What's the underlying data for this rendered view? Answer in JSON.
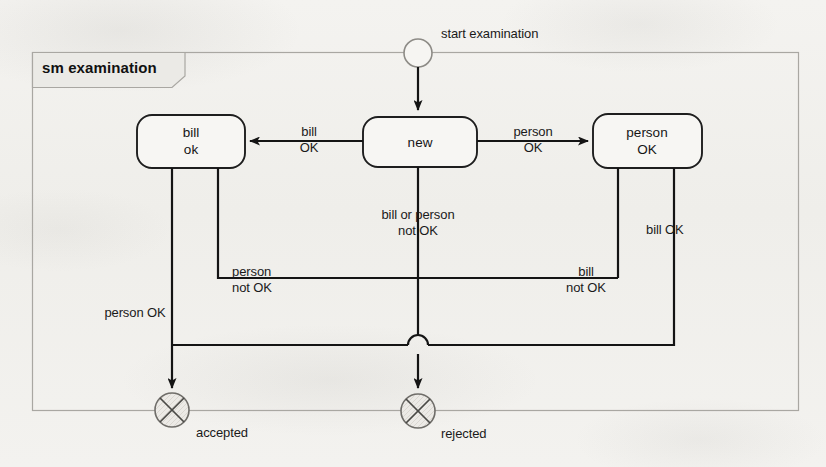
{
  "diagram": {
    "kind": "uml-state-machine",
    "frame": {
      "title": "sm examination",
      "border_color": "#a9a7a2",
      "tab_fill": "#ebeae6"
    },
    "background_color": "#f2f1ee",
    "line_color": "#1a1a1a",
    "states": [
      {
        "id": "bill-ok",
        "line1": "bill",
        "line2": "ok"
      },
      {
        "id": "new",
        "line1": "new",
        "line2": ""
      },
      {
        "id": "person-ok",
        "line1": "person",
        "line2": "OK"
      }
    ],
    "pseudostates": [
      {
        "id": "initial",
        "type": "initial",
        "label": "start examination"
      },
      {
        "id": "terminate-accepted",
        "type": "terminate",
        "label": "accepted"
      },
      {
        "id": "terminate-rejected",
        "type": "terminate",
        "label": "rejected"
      }
    ],
    "transitions": [
      {
        "id": "t1",
        "from": "initial",
        "to": "new",
        "label_line1": "",
        "label_line2": ""
      },
      {
        "id": "t2",
        "from": "new",
        "to": "bill-ok",
        "label_line1": "bill",
        "label_line2": "OK"
      },
      {
        "id": "t3",
        "from": "new",
        "to": "person-ok",
        "label_line1": "person",
        "label_line2": "OK"
      },
      {
        "id": "t4",
        "from": "new",
        "to": "terminate-rejected",
        "label_line1": "bill or person",
        "label_line2": "not OK"
      },
      {
        "id": "t5",
        "from": "bill-ok",
        "to": "terminate-rejected",
        "label_line1": "person",
        "label_line2": "not OK"
      },
      {
        "id": "t6",
        "from": "bill-ok",
        "to": "terminate-accepted",
        "label_line1": "person OK",
        "label_line2": ""
      },
      {
        "id": "t7",
        "from": "person-ok",
        "to": "terminate-rejected",
        "label_line1": "bill",
        "label_line2": "not OK"
      },
      {
        "id": "t8",
        "from": "person-ok",
        "to": "terminate-accepted",
        "label_line1": "bill OK",
        "label_line2": ""
      }
    ]
  }
}
